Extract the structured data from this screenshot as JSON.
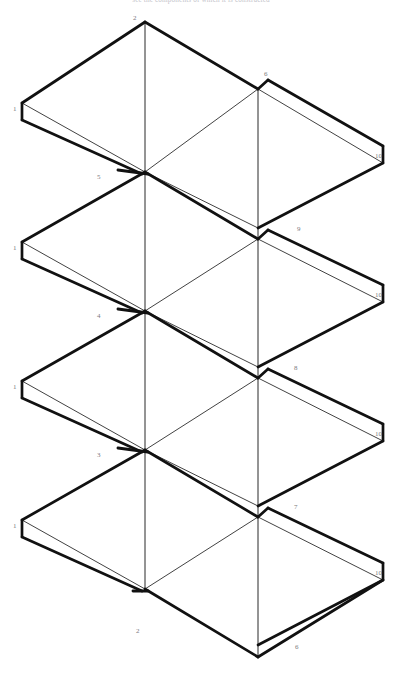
{
  "document": {
    "type": "patent-figure",
    "clipped_header_text": "see the components of which it is constructed",
    "background_color": "#ffffff",
    "ink_color": "#111111",
    "label_color": "#7a7a80",
    "width": 402,
    "height": 678
  },
  "figure": {
    "unit_count": 4,
    "unit_pitch": 139,
    "center_x_left": 145,
    "center_x_right": 258
  },
  "reference_numerals": [
    {
      "id": "n1-u1",
      "text": "1",
      "x": 13,
      "y": 106
    },
    {
      "id": "n2-top",
      "text": "2",
      "x": 133,
      "y": 15
    },
    {
      "id": "n6-u1",
      "text": "6",
      "x": 264,
      "y": 71
    },
    {
      "id": "n10-u1",
      "text": "10",
      "x": 375,
      "y": 153
    },
    {
      "id": "n5-u1",
      "text": "5",
      "x": 97,
      "y": 174
    },
    {
      "id": "n1-u2",
      "text": "1",
      "x": 13,
      "y": 245
    },
    {
      "id": "n9-u2",
      "text": "9",
      "x": 297,
      "y": 226
    },
    {
      "id": "n10-u2",
      "text": "10",
      "x": 375,
      "y": 292
    },
    {
      "id": "n4-u2",
      "text": "4",
      "x": 97,
      "y": 313
    },
    {
      "id": "n1-u3",
      "text": "1",
      "x": 13,
      "y": 384
    },
    {
      "id": "n8-u3",
      "text": "8",
      "x": 294,
      "y": 365
    },
    {
      "id": "n10-u3",
      "text": "10",
      "x": 375,
      "y": 431
    },
    {
      "id": "n3-u3",
      "text": "3",
      "x": 97,
      "y": 452
    },
    {
      "id": "n1-u4",
      "text": "1",
      "x": 13,
      "y": 523
    },
    {
      "id": "n7-u4",
      "text": "7",
      "x": 294,
      "y": 504
    },
    {
      "id": "n10-u4",
      "text": "10",
      "x": 375,
      "y": 570
    },
    {
      "id": "n2-u4",
      "text": "2",
      "x": 136,
      "y": 628
    },
    {
      "id": "n6-bot",
      "text": "6",
      "x": 295,
      "y": 644
    }
  ],
  "geometry": {
    "stroke_thick": 2.6,
    "stroke_thin": 0.8,
    "stroke_hair": 0.7,
    "note": "Each unit is a flattened isometric diamond panel with a folded lip at left (1) and right (10); apex fold lines run vertically at x=145 and x=258."
  }
}
